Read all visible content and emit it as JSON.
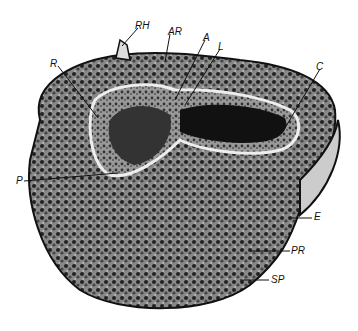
{
  "figure": {
    "labels": [
      {
        "id": "RH",
        "text": "RH",
        "x": 135,
        "y": 21
      },
      {
        "id": "AR",
        "text": "AR",
        "x": 168,
        "y": 27
      },
      {
        "id": "A",
        "text": "A",
        "x": 203,
        "y": 33
      },
      {
        "id": "L",
        "text": "L",
        "x": 218,
        "y": 42
      },
      {
        "id": "R",
        "text": "R",
        "x": 50,
        "y": 59
      },
      {
        "id": "C",
        "text": "C",
        "x": 316,
        "y": 62
      },
      {
        "id": "P",
        "text": "P",
        "x": 16,
        "y": 178
      },
      {
        "id": "E",
        "text": "E",
        "x": 314,
        "y": 214
      },
      {
        "id": "PR",
        "text": "PR",
        "x": 291,
        "y": 248
      },
      {
        "id": "SP",
        "text": "SP",
        "x": 271,
        "y": 278
      }
    ]
  }
}
